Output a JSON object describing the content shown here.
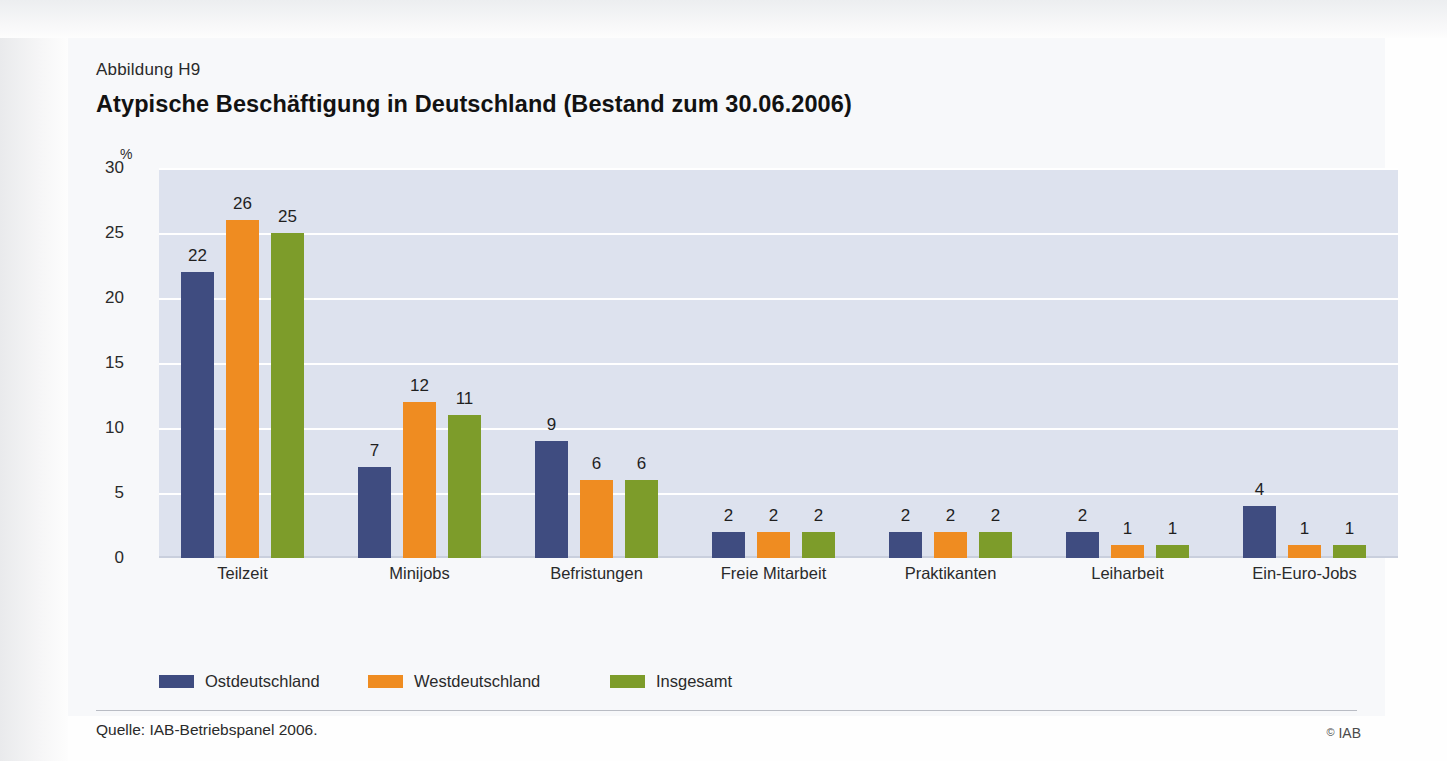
{
  "figure": {
    "number": "Abbildung H9",
    "title": "Atypische Beschäftigung in Deutschland (Bestand zum 30.06.2006)",
    "source": "Quelle: IAB-Betriebspanel 2006.",
    "copyright_mark": "©",
    "copyright_text": "IAB"
  },
  "colors": {
    "series_ost": "#3f4c80",
    "series_west": "#ef8c21",
    "series_insgesamt": "#7d9c2a",
    "plot_background": "#dde2ee",
    "gridline": "#ffffff",
    "card_background": "#f7f8fa"
  },
  "chart_data": {
    "type": "bar",
    "title": "Atypische Beschäftigung in Deutschland (Bestand zum 30.06.2006)",
    "xlabel": "",
    "ylabel": "%",
    "ylim": [
      0,
      30
    ],
    "yticks": [
      0,
      5,
      10,
      15,
      20,
      25,
      30
    ],
    "grid": true,
    "legend_position": "bottom-left",
    "categories": [
      "Teilzeit",
      "Minijobs",
      "Befristungen",
      "Freie Mitarbeit",
      "Praktikanten",
      "Leiharbeit",
      "Ein-Euro-Jobs"
    ],
    "series": [
      {
        "name": "Ostdeutschland",
        "color": "#3f4c80",
        "values": [
          22,
          7,
          9,
          2,
          2,
          2,
          4
        ]
      },
      {
        "name": "Westdeutschland",
        "color": "#ef8c21",
        "values": [
          26,
          12,
          6,
          2,
          2,
          1,
          1
        ]
      },
      {
        "name": "Insgesamt",
        "color": "#7d9c2a",
        "values": [
          25,
          11,
          6,
          2,
          2,
          1,
          1
        ]
      }
    ]
  }
}
